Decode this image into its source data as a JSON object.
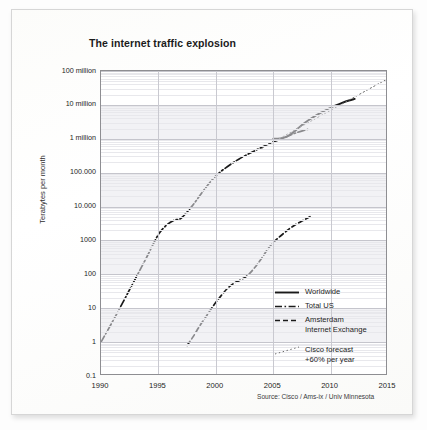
{
  "chart_data": {
    "type": "line",
    "title": "The internet traffic explosion",
    "xlabel": "",
    "ylabel": "Terabytes per month",
    "xlim": [
      1990,
      2015
    ],
    "ylim": [
      0.1,
      100000000
    ],
    "yscale": "log",
    "grid": true,
    "legend_position": "inside-right",
    "xticks": [
      "1990",
      "1995",
      "2000",
      "2005",
      "2010",
      "2015"
    ],
    "xtick_values": [
      1990,
      1995,
      2000,
      2005,
      2010,
      2015
    ],
    "yticks": [
      "100 million",
      "10 million",
      "1 million",
      "100.000",
      "10.000",
      "1000",
      "100",
      "10",
      "1",
      "0.1"
    ],
    "ytick_values": [
      100000000,
      10000000,
      1000000,
      100000,
      10000,
      1000,
      100,
      10,
      1,
      0.1
    ],
    "source": "Source: Cisco / Ams-ix / Univ Minnesota",
    "series": [
      {
        "name": "Worldwide",
        "style": "solid",
        "color": "#1a1a1a",
        "x": [
          2005.0,
          2005.6,
          2006.2,
          2006.8,
          2007.4,
          2008.0,
          2008.6,
          2009.2,
          2009.8,
          2010.4,
          2011.0,
          2011.6,
          2012.1
        ],
        "y": [
          1000000,
          1020000,
          1150000,
          1600000,
          2400000,
          3400000,
          4600000,
          6000000,
          7700000,
          9500000,
          11500000,
          13500000,
          15000000
        ]
      },
      {
        "name": "Total US",
        "style": "dashdot",
        "color": "#1a1a1a",
        "x": [
          1990,
          1991,
          1992,
          1993,
          1994,
          1995,
          1995.8,
          1996.4,
          1997,
          1998,
          1999,
          2000,
          2001,
          2002,
          2003,
          2004,
          2005,
          2006,
          2007,
          2008
        ],
        "y": [
          1,
          4,
          17,
          75,
          330,
          1500,
          3000,
          4000,
          4600,
          11000,
          32000,
          80000,
          150000,
          250000,
          380000,
          560000,
          800000,
          1100000,
          1500000,
          1900000
        ]
      },
      {
        "name": "Amsterdam Internet Exchange",
        "style": "dashed",
        "color": "#1a1a1a",
        "x": [
          1997.5,
          1998,
          1998.6,
          1999.2,
          1999.8,
          2000.4,
          2001,
          2001.6,
          2002.2,
          2002.8,
          2003.4,
          2004,
          2004.6,
          2005.2,
          2005.8,
          2006.4,
          2007,
          2007.6,
          2008.2
        ],
        "y": [
          0.8,
          1.4,
          3,
          6,
          12,
          22,
          38,
          55,
          70,
          95,
          160,
          300,
          600,
          1000,
          1500,
          2200,
          3000,
          3900,
          5000
        ]
      },
      {
        "name": "Cisco forecast +60% per year",
        "style": "dotted",
        "color": "#6a6a6a",
        "x": [
          2004.0,
          2015.0
        ],
        "y": [
          520000,
          60000000
        ]
      }
    ],
    "legend": [
      {
        "label": "Worldwide",
        "style": "solid"
      },
      {
        "label": "Total US",
        "style": "dashdot"
      },
      {
        "label": "Amsterdam\nInternet Exchange",
        "style": "dashed"
      },
      {
        "label": "Cisco forecast\n+60% per year",
        "style": "dotted"
      }
    ]
  },
  "page": {
    "title": "The internet traffic explosion",
    "y_axis_caption": "Terabytes per month",
    "source": "Source: Cisco / Ams-ix / Univ Minnesota"
  }
}
